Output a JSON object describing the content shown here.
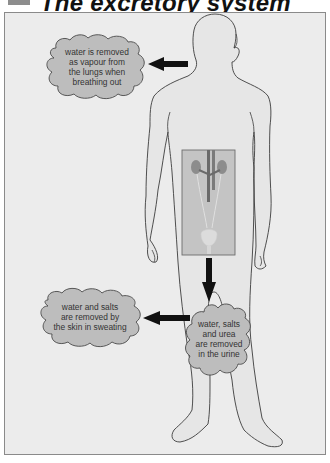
{
  "header": {
    "title": "The excretory system"
  },
  "diagram": {
    "colors": {
      "background": "#ececec",
      "frame_border": "#8a8a8a",
      "cloud_fill": "#bdbdbd",
      "organ_box_fill": "#c4c4c4",
      "arrow": "#111111",
      "outline": "#444444"
    },
    "callouts": [
      {
        "id": "lungs",
        "lines": [
          "water is removed",
          "as vapour from",
          "the lungs when",
          "breathing out"
        ],
        "arrow_direction": "left"
      },
      {
        "id": "skin",
        "lines": [
          "water and salts",
          "are removed by",
          "the skin in sweating"
        ],
        "arrow_direction": "left"
      },
      {
        "id": "kidneys",
        "lines": [
          "water, salts",
          "and urea",
          "are removed",
          "in the urine"
        ],
        "arrow_direction": "down"
      }
    ],
    "organ_inset": {
      "label": "kidneys, ureters and bladder"
    }
  }
}
